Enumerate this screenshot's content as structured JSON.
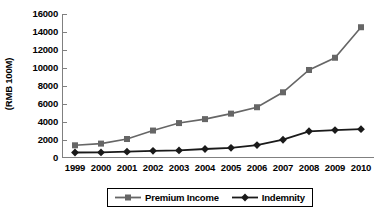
{
  "chart_data": {
    "type": "line",
    "title": "",
    "xlabel": "",
    "ylabel": "(RMB 100M)",
    "categories": [
      "1999",
      "2000",
      "2001",
      "2002",
      "2003",
      "2004",
      "2005",
      "2006",
      "2007",
      "2008",
      "2009",
      "2010"
    ],
    "ylim": [
      0,
      16000
    ],
    "ytick_step": 2000,
    "yticks": [
      "16000",
      "14000",
      "12000",
      "10000",
      "8000",
      "6000",
      "4000",
      "2000",
      "0"
    ],
    "grid": false,
    "legend_position": "bottom-center",
    "series": [
      {
        "name": "Premium Income",
        "color": "#666666",
        "marker": "square",
        "values": [
          1410,
          1600,
          2110,
          3050,
          3880,
          4320,
          4930,
          5640,
          7300,
          9780,
          11140,
          14530
        ]
      },
      {
        "name": "Indemnity",
        "color": "#1a1a1a",
        "marker": "diamond",
        "values": [
          610,
          620,
          700,
          800,
          840,
          1000,
          1130,
          1440,
          2030,
          2970,
          3100,
          3200
        ]
      }
    ]
  },
  "legend": {
    "items": [
      {
        "label": "Premium Income",
        "marker": "square-marker-icon"
      },
      {
        "label": "Indemnity",
        "marker": "diamond-marker-icon"
      }
    ]
  },
  "axes": {
    "y_title": "(RMB 100M)",
    "axis_color": "#808080"
  }
}
